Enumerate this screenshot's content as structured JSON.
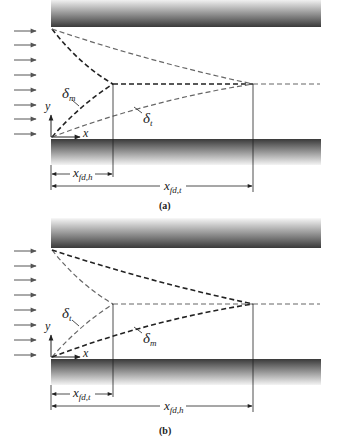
{
  "figure": {
    "panels": [
      {
        "id": "a",
        "caption": "(a)",
        "inner_delta_label": "δ",
        "inner_delta_sub": "m",
        "outer_delta_label": "δ",
        "outer_delta_sub": "t",
        "short_dim_label": "x",
        "short_dim_sub": "fd,h",
        "long_dim_label": "x",
        "long_dim_sub": "fd,t",
        "axis_y": "y",
        "axis_x": "x"
      },
      {
        "id": "b",
        "caption": "(b)",
        "inner_delta_label": "δ",
        "inner_delta_sub": "t",
        "outer_delta_label": "δ",
        "outer_delta_sub": "m",
        "short_dim_label": "x",
        "short_dim_sub": "fd,t",
        "long_dim_label": "x",
        "long_dim_sub": "fd,h",
        "axis_y": "y",
        "axis_x": "x"
      }
    ],
    "inflow_arrow_count": 8,
    "colors": {
      "plate_dark": "#3a3a3a",
      "plate_light": "#f2f2f2",
      "dash_dark": "#222222",
      "dash_light": "#777777",
      "arrow": "#555555"
    }
  }
}
